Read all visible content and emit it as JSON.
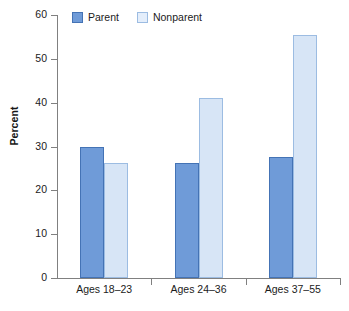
{
  "chart_data": {
    "type": "bar",
    "title": "",
    "subtitle": "",
    "xlabel": "",
    "ylabel": "Percent",
    "ylim": [
      0,
      60
    ],
    "yticks": [
      0,
      10,
      20,
      30,
      40,
      50,
      60
    ],
    "ytick_labels": [
      "0",
      "10",
      "20",
      "30",
      "40",
      "50",
      "60"
    ],
    "grid": false,
    "legend_position": "top-left",
    "categories": [
      "Ages 18–23",
      "Ages 24–36",
      "Ages 37–55"
    ],
    "series": [
      {
        "name": "Parent",
        "color": "#6f9bd8",
        "border_color": "#4473b5",
        "values": [
          30.0,
          26.3,
          27.5
        ]
      },
      {
        "name": "Nonparent",
        "color": "#d7e5f6",
        "border_color": "#9cbce2",
        "values": [
          26.3,
          41.0,
          55.5
        ]
      }
    ],
    "annotations": []
  },
  "axis": {
    "y_title": "Percent",
    "y_tick_labels": [
      "60",
      "50",
      "40",
      "30",
      "20",
      "10",
      "0"
    ],
    "x_tick_labels": [
      "Ages 18–23",
      "Ages 24–36",
      "Ages 37–55"
    ]
  },
  "legend": {
    "items": [
      {
        "label": "Parent",
        "swatch": "parent-swatch-icon"
      },
      {
        "label": "Nonparent",
        "swatch": "nonparent-swatch-icon"
      }
    ]
  }
}
